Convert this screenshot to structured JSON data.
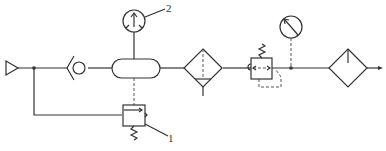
{
  "diagram": {
    "type": "pneumatic-schematic",
    "labels": {
      "callout_1": "1",
      "callout_2": "2"
    },
    "components": [
      {
        "id": "source",
        "symbol": "pressure-source-triangle"
      },
      {
        "id": "check-valve",
        "symbol": "check-valve"
      },
      {
        "id": "air-tank",
        "symbol": "air-receiver"
      },
      {
        "id": "pressure-gauge-2",
        "symbol": "pressure-gauge",
        "callout": "2"
      },
      {
        "id": "pressure-switch-1",
        "symbol": "pressure-relief-valve",
        "callout": "1"
      },
      {
        "id": "filter-drain",
        "symbol": "filter-with-drain"
      },
      {
        "id": "pressure-regulator",
        "symbol": "pressure-reducing-valve"
      },
      {
        "id": "pressure-gauge",
        "symbol": "pressure-gauge"
      },
      {
        "id": "lubricator",
        "symbol": "lubricator"
      },
      {
        "id": "outlet",
        "symbol": "flow-arrow"
      }
    ]
  }
}
